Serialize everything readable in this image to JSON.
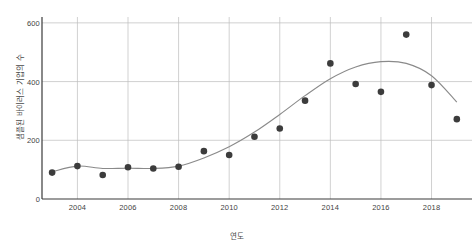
{
  "chart_data": {
    "type": "scatter",
    "title": "",
    "subtitle": "",
    "xlabel": "연도",
    "ylabel": "샘플된 바이러스 기업의 수",
    "x": [
      2003,
      2004,
      2005,
      2006,
      2007,
      2008,
      2009,
      2010,
      2011,
      2012,
      2013,
      2014,
      2015,
      2016,
      2017,
      2018,
      2019
    ],
    "values": [
      90,
      112,
      82,
      108,
      104,
      110,
      163,
      150,
      212,
      240,
      335,
      462,
      392,
      365,
      560,
      388,
      272
    ],
    "series": [
      {
        "name": "샘플된 바이러스 기업의 수",
        "values": [
          90,
          112,
          82,
          108,
          104,
          110,
          163,
          150,
          212,
          240,
          335,
          462,
          392,
          365,
          560,
          388,
          272
        ]
      }
    ],
    "trend": {
      "name": "smoothed-trend",
      "x": [
        2003,
        2004,
        2005,
        2006,
        2007,
        2008,
        2009,
        2010,
        2011,
        2012,
        2013,
        2014,
        2015,
        2016,
        2017,
        2018,
        2019
      ],
      "values": [
        93,
        112,
        104,
        105,
        104,
        112,
        140,
        178,
        228,
        288,
        352,
        410,
        450,
        468,
        462,
        420,
        330
      ]
    },
    "xlim": [
      2002.6,
      2019.6
    ],
    "ylim": [
      0,
      620
    ],
    "xticks": [
      2004,
      2006,
      2008,
      2010,
      2012,
      2014,
      2016,
      2018
    ],
    "xtick_labels": [
      "2004",
      "2006",
      "2008",
      "2010",
      "2012",
      "2014",
      "2016",
      "2018"
    ],
    "yticks": [
      0,
      200,
      400,
      600
    ],
    "ytick_labels": [
      "0",
      "200",
      "400",
      "600"
    ],
    "grid": true,
    "grid_axes": "both",
    "legend": "none",
    "marker": "filled-circle",
    "marker_color": "#3c3c3c",
    "line_color": "#8a8a8a",
    "grid_color": "#bdbdbd",
    "axis_color": "#3a3a3a",
    "background": "#ffffff"
  }
}
